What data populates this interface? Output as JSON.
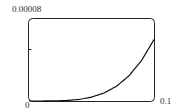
{
  "chart_data": {
    "type": "line",
    "title": "",
    "xlabel": "",
    "ylabel": "",
    "xlim": [
      0,
      0.1
    ],
    "ylim": [
      0,
      8e-05
    ],
    "x_tick_labels": [
      "0",
      "0.1"
    ],
    "y_tick_labels": [
      "0.00008"
    ],
    "y_minor_tick": 4e-05,
    "grid": false,
    "legend": null,
    "series": [
      {
        "name": "curve",
        "x": [
          0,
          0.01,
          0.02,
          0.03,
          0.04,
          0.05,
          0.06,
          0.07,
          0.08,
          0.09,
          0.1
        ],
        "y": [
          0,
          1e-08,
          1e-07,
          5e-07,
          1.5e-06,
          3.8e-06,
          7.8e-06,
          1.44e-05,
          2.46e-05,
          3.94e-05,
          6e-05
        ]
      }
    ]
  },
  "labels": {
    "y_max": "0.00008",
    "x_min": "0",
    "x_max": "0.1"
  }
}
